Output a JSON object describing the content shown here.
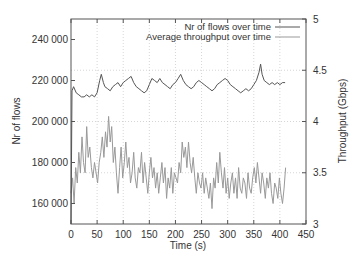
{
  "chart_data": {
    "type": "line",
    "title": "",
    "xlabel": "Time (s)",
    "ylabel": "Nr of flows",
    "y2label": "Throughput (Gbps)",
    "xlim": [
      0,
      450
    ],
    "ylim": [
      150000,
      250000
    ],
    "y2lim": [
      3,
      5
    ],
    "x_ticks": [
      0,
      50,
      100,
      150,
      200,
      250,
      300,
      350,
      400,
      450
    ],
    "y_ticks": [
      160000,
      180000,
      200000,
      220000,
      240000
    ],
    "y_tick_labels": [
      "160 000",
      "180 000",
      "200 000",
      "220 000",
      "240 000"
    ],
    "y2_ticks": [
      3,
      3.5,
      4,
      4.5,
      5
    ],
    "y2_tick_labels": [
      "3",
      "3.5",
      "4",
      "4.5",
      "5"
    ],
    "grid": true,
    "legend_position": "upper right",
    "series": [
      {
        "name": "Nr of flows over time",
        "axis": "left",
        "color": "#555555",
        "x": [
          0,
          2,
          5,
          10,
          15,
          20,
          25,
          30,
          35,
          40,
          45,
          50,
          55,
          58,
          62,
          65,
          70,
          75,
          80,
          85,
          90,
          95,
          100,
          105,
          110,
          115,
          120,
          125,
          130,
          135,
          140,
          145,
          150,
          155,
          160,
          165,
          170,
          175,
          180,
          185,
          190,
          195,
          200,
          205,
          210,
          215,
          220,
          225,
          230,
          235,
          240,
          245,
          250,
          255,
          260,
          265,
          270,
          275,
          280,
          285,
          290,
          295,
          300,
          305,
          310,
          315,
          320,
          325,
          330,
          335,
          340,
          345,
          350,
          355,
          360,
          363,
          366,
          370,
          375,
          380,
          385,
          390,
          395,
          400,
          405,
          410
        ],
        "values": [
          150000,
          215000,
          217000,
          214000,
          213000,
          212000,
          212000,
          213000,
          212000,
          213000,
          212000,
          214000,
          220000,
          223000,
          219000,
          217000,
          216000,
          215000,
          217000,
          218000,
          219000,
          217000,
          219000,
          220000,
          221000,
          222000,
          219000,
          217000,
          216000,
          215000,
          214000,
          215000,
          218000,
          221000,
          220000,
          219000,
          221000,
          219000,
          218000,
          217000,
          216000,
          218000,
          219000,
          221000,
          223000,
          220000,
          218000,
          217000,
          216000,
          217000,
          219000,
          220000,
          219000,
          218000,
          217000,
          216000,
          215000,
          216000,
          218000,
          219000,
          220000,
          221000,
          220000,
          218000,
          217000,
          216000,
          215000,
          214000,
          215000,
          216000,
          215000,
          216000,
          218000,
          220000,
          224000,
          228000,
          223000,
          220000,
          219000,
          218000,
          219000,
          218000,
          219000,
          218000,
          219000,
          219000
        ]
      },
      {
        "name": "Average throughput over time",
        "axis": "right",
        "color": "#999999",
        "x": [
          0,
          3,
          6,
          9,
          12,
          15,
          18,
          21,
          24,
          27,
          30,
          33,
          36,
          39,
          42,
          45,
          48,
          51,
          54,
          57,
          60,
          63,
          66,
          69,
          72,
          75,
          78,
          81,
          84,
          87,
          90,
          93,
          96,
          99,
          102,
          105,
          108,
          111,
          114,
          117,
          120,
          123,
          126,
          129,
          132,
          135,
          138,
          141,
          144,
          147,
          150,
          153,
          156,
          159,
          162,
          165,
          168,
          171,
          174,
          177,
          180,
          183,
          186,
          189,
          192,
          195,
          198,
          201,
          204,
          207,
          210,
          213,
          216,
          219,
          222,
          225,
          228,
          231,
          234,
          237,
          240,
          243,
          246,
          249,
          252,
          255,
          258,
          261,
          264,
          267,
          270,
          273,
          276,
          279,
          282,
          285,
          288,
          291,
          294,
          297,
          300,
          303,
          306,
          309,
          312,
          315,
          318,
          321,
          324,
          327,
          330,
          333,
          336,
          339,
          342,
          345,
          348,
          351,
          354,
          357,
          360,
          363,
          366,
          369,
          372,
          375,
          378,
          381,
          384,
          387,
          390,
          393,
          396,
          399,
          402,
          405,
          408,
          411
        ],
        "values": [
          3.3,
          3.45,
          3.2,
          3.55,
          3.4,
          3.7,
          3.5,
          3.85,
          3.6,
          3.5,
          3.95,
          3.65,
          3.75,
          3.55,
          3.45,
          3.6,
          3.5,
          3.4,
          3.6,
          3.7,
          3.85,
          3.65,
          3.9,
          3.75,
          4.05,
          3.8,
          3.95,
          3.6,
          3.75,
          3.5,
          3.3,
          3.55,
          3.75,
          3.45,
          3.6,
          3.8,
          3.55,
          3.65,
          3.4,
          3.5,
          3.7,
          3.45,
          3.35,
          3.55,
          3.5,
          3.7,
          3.4,
          3.6,
          3.45,
          3.3,
          3.5,
          3.65,
          3.45,
          3.55,
          3.35,
          3.5,
          3.3,
          3.45,
          3.6,
          3.4,
          3.55,
          3.25,
          3.45,
          3.35,
          3.55,
          3.3,
          3.5,
          3.45,
          3.4,
          3.6,
          3.5,
          3.8,
          3.65,
          3.75,
          3.55,
          3.8,
          3.6,
          3.5,
          3.65,
          3.45,
          3.3,
          3.5,
          3.4,
          3.35,
          3.5,
          3.3,
          3.45,
          3.35,
          3.25,
          3.4,
          3.15,
          3.45,
          3.35,
          3.6,
          3.4,
          3.7,
          3.5,
          3.35,
          3.55,
          3.3,
          3.45,
          3.25,
          3.4,
          3.5,
          3.3,
          3.45,
          3.25,
          3.55,
          3.35,
          3.3,
          3.45,
          3.4,
          3.25,
          3.5,
          3.35,
          3.3,
          3.45,
          3.55,
          3.4,
          3.6,
          3.45,
          3.3,
          3.5,
          3.4,
          3.25,
          3.45,
          3.35,
          3.5,
          3.3,
          3.2,
          3.4,
          3.35,
          3.25,
          3.45,
          3.3,
          3.2,
          3.35,
          3.55
        ]
      }
    ],
    "reference_lines": [
      {
        "axis": "right",
        "value": 4.5,
        "style": "dotted"
      },
      {
        "axis": "right",
        "value": 3.5,
        "style": "dotted"
      }
    ]
  },
  "labels": {
    "xlabel": "Time (s)",
    "ylabel": "Nr of flows",
    "y2label": "Throughput (Gbps)",
    "legend_flows": "Nr of flows over time",
    "legend_throughput": "Average throughput over time"
  }
}
